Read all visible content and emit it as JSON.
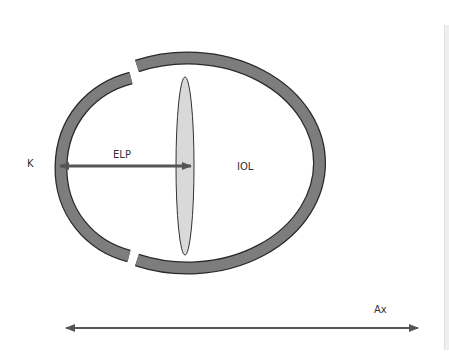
{
  "labels": {
    "cornea": "K",
    "elp": "ELP",
    "iol": "IOL",
    "axial_length": "Ax"
  },
  "colors": {
    "wall_fill": "#7a7a7a",
    "wall_stroke": "#2a2a2a",
    "lens_fill": "#d9d9d9",
    "arrow": "#555555",
    "text": "#333333"
  }
}
